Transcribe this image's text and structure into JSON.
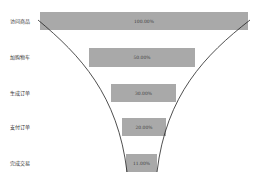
{
  "chart_data": {
    "type": "funnel",
    "title": "",
    "categories": [
      "访问商品",
      "加购物车",
      "生成订单",
      "支付订单",
      "完成交易"
    ],
    "values": [
      100.0,
      50.0,
      30.0,
      20.0,
      11.0
    ],
    "labels": [
      "100.00%",
      "50.00%",
      "30.00%",
      "20.00%",
      "11.00%"
    ],
    "bar_color": "#a9a9a9",
    "curve_color": "#222222"
  },
  "bars": [
    {
      "name": "访问商品",
      "label": "100.00%",
      "x": 40,
      "y": 12,
      "w": 208,
      "h": 18
    },
    {
      "name": "加购物车",
      "label": "50.00%",
      "x": 89,
      "y": 48,
      "w": 106,
      "h": 19
    },
    {
      "name": "生成订单",
      "label": "30.00%",
      "x": 111,
      "y": 84,
      "w": 65,
      "h": 18
    },
    {
      "name": "支付订单",
      "label": "20.00%",
      "x": 122,
      "y": 118,
      "w": 44,
      "h": 18
    },
    {
      "name": "完成交易",
      "label": "11.00%",
      "x": 126,
      "y": 154,
      "w": 31,
      "h": 18
    }
  ]
}
